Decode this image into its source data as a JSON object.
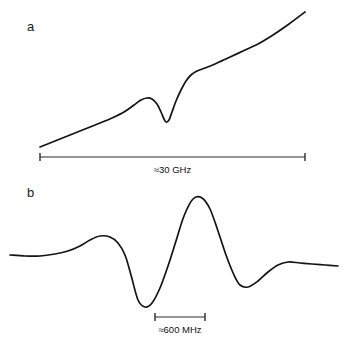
{
  "figure": {
    "background_color": "#ffffff",
    "trace_color": "#141414",
    "axis_color": "#2b2b2b"
  },
  "panels": {
    "a": {
      "label": "a",
      "scale_label": "≈30 GHz"
    },
    "b": {
      "label": "b",
      "scale_label": "≈600 MHz"
    }
  },
  "chart_data": [
    {
      "type": "line",
      "title": "",
      "panel": "a",
      "xlabel": "",
      "ylabel": "",
      "grid": false,
      "legend": null,
      "annotations": [
        {
          "text": "a",
          "role": "panel-label"
        },
        {
          "text": "≈30 GHz",
          "role": "scale-bar-label"
        }
      ],
      "scale_bar": {
        "label": "≈30 GHz",
        "x_start_px": 40,
        "x_end_px": 305,
        "y_px": 157
      },
      "description": "Sloping baseline with a dispersive absorption feature: small hump followed by a sharp dip, then a steep rise onto a higher sloping baseline.",
      "xlim": [
        0,
        343
      ],
      "ylim": [
        180,
        0
      ],
      "x": [
        40,
        55,
        70,
        85,
        100,
        112,
        124,
        134,
        141,
        147,
        152,
        157,
        161,
        164,
        166,
        169,
        172,
        176,
        181,
        186,
        191,
        197,
        205,
        215,
        228,
        243,
        258,
        273,
        289,
        305
      ],
      "y": [
        147,
        141,
        135,
        129,
        123,
        118,
        112,
        105,
        100,
        98,
        99,
        104,
        112,
        119,
        122,
        120,
        112,
        101,
        90,
        81,
        75,
        71,
        68,
        64,
        58,
        51,
        44,
        35,
        24,
        12
      ]
    },
    {
      "type": "line",
      "title": "",
      "panel": "b",
      "xlabel": "",
      "ylabel": "",
      "grid": false,
      "legend": null,
      "annotations": [
        {
          "text": "b",
          "role": "panel-label"
        },
        {
          "text": "≈600 MHz",
          "role": "scale-bar-label"
        }
      ],
      "scale_bar": {
        "label": "≈600 MHz",
        "x_start_px": 155,
        "x_end_px": 205,
        "y_px": 317
      },
      "description": "First-derivative lineshape: flat baseline, a positive lobe, a deep negative trough, a tall positive peak, a second negative trough and a small positive bump returning to baseline.",
      "xlim": [
        0,
        343
      ],
      "ylim": [
        348,
        180
      ],
      "x": [
        10,
        25,
        40,
        55,
        68,
        80,
        90,
        100,
        110,
        118,
        125,
        131,
        138,
        145,
        152,
        160,
        168,
        176,
        184,
        193,
        202,
        210,
        218,
        226,
        234,
        240,
        248,
        258,
        268,
        278,
        288,
        300,
        312,
        325,
        338
      ],
      "y": [
        255,
        256,
        256,
        254,
        251,
        246,
        240,
        236,
        237,
        243,
        255,
        275,
        300,
        307,
        303,
        288,
        266,
        241,
        216,
        199,
        198,
        209,
        231,
        255,
        275,
        285,
        287,
        281,
        272,
        265,
        262,
        263,
        264,
        265,
        266
      ]
    }
  ]
}
